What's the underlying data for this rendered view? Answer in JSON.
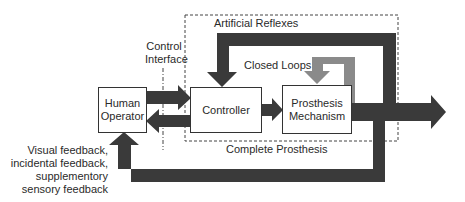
{
  "diagram": {
    "type": "block-diagram",
    "blocks": {
      "human_operator": "Human Operator",
      "human_operator_line1": "Human",
      "human_operator_line2": "Operator",
      "controller": "Controller",
      "prosthesis_mechanism_line1": "Prosthesis",
      "prosthesis_mechanism_line2": "Mechanism"
    },
    "labels": {
      "control_interface_line1": "Control",
      "control_interface_line2": "Interface",
      "artificial_reflexes": "Artificial Reflexes",
      "closed_loops": "Closed Loops",
      "complete_prosthesis": "Complete Prosthesis",
      "feedback_line1": "Visual feedback,",
      "feedback_line2": "incidental feedback,",
      "feedback_line3": "supplementory",
      "feedback_line4": "sensory feedback"
    },
    "colors": {
      "dark_arrow": "#3a3a3a",
      "gray_arrow": "#8a8a8a",
      "box_border": "#333333",
      "dashed_border": "#444444"
    }
  }
}
